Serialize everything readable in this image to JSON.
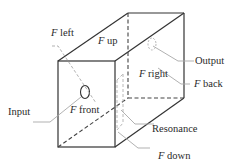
{
  "diagram": {
    "type": "cavity-box",
    "labels": {
      "f_left": {
        "var": "F",
        "text": " left"
      },
      "f_up": {
        "var": "F",
        "text": " up"
      },
      "f_right": {
        "var": "F",
        "text": " right"
      },
      "f_back": {
        "var": "F",
        "text": " back"
      },
      "f_front": {
        "var": "F",
        "text": " front"
      },
      "f_down": {
        "var": "F",
        "text": " down"
      },
      "output": "Output",
      "input": "Input",
      "resonance": "Resonance"
    },
    "colors": {
      "edge": "#333333",
      "hidden_edge": "#444444",
      "leader": "#a0a0a0",
      "port": "#333333"
    }
  }
}
